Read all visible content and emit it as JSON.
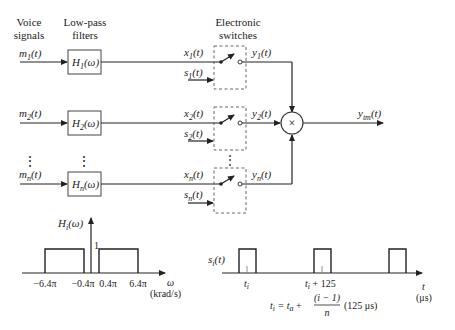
{
  "headers": {
    "voice": [
      "Voice",
      "signals"
    ],
    "filters": [
      "Low-pass",
      "filters"
    ],
    "switches": [
      "Electronic",
      "switches"
    ]
  },
  "channels": [
    {
      "m": "m",
      "m_sub": "1",
      "H": "H",
      "H_sub": "1",
      "x": "x",
      "x_sub": "1",
      "s": "s",
      "s_sub": "1",
      "y": "y",
      "y_sub": "1"
    },
    {
      "m": "m",
      "m_sub": "2",
      "H": "H",
      "H_sub": "2",
      "x": "x",
      "x_sub": "2",
      "s": "s",
      "s_sub": "2",
      "y": "y",
      "y_sub": "2"
    },
    {
      "m": "m",
      "m_sub": "n",
      "H": "H",
      "H_sub": "n",
      "x": "x",
      "x_sub": "n",
      "s": "s",
      "s_sub": "n",
      "y": "y",
      "y_sub": "n"
    }
  ],
  "arg_t": "(t)",
  "arg_w": "(ω)",
  "ellipsis": "⋮",
  "summer": {
    "symbol": "×"
  },
  "output": {
    "label": "y",
    "sub": "tm",
    "arg": "(t)"
  },
  "filter_response": {
    "ylabel": "H",
    "ylabel_sub": "i",
    "ylabel_arg": "(ω)",
    "level": "1",
    "ticks": [
      "−6.4π",
      "−0.4π",
      "0.4π",
      "6.4π"
    ],
    "xlabel": "ω",
    "xunit": "(krad/s)"
  },
  "sampling": {
    "ylabel": "s",
    "ylabel_sub": "i",
    "ylabel_arg": "(t)",
    "tick1": "t",
    "tick1_sub": "i",
    "tick2": "t",
    "tick2_sub": "i",
    "tick2_rest": " + 125",
    "xlabel": "t",
    "xunit": "(μs)",
    "formula": {
      "lhs": "t",
      "lhs_sub": "i",
      "eq": " = t",
      "eq_sub": "a",
      "plus": " +",
      "numer": "(i − 1)",
      "denom": "n",
      "tail": "(125 μs)"
    }
  }
}
